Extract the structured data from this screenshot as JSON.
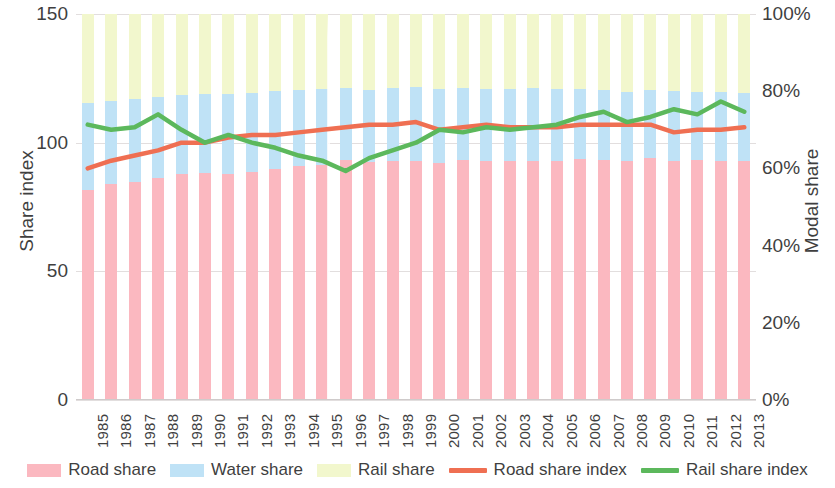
{
  "chart_data": {
    "type": "bar",
    "title": "",
    "subtitle": "",
    "xlabel": "",
    "ylabel": "Share index",
    "y2label": "Modal share",
    "grid": true,
    "legend_position": "bottom",
    "ylim": [
      0,
      150
    ],
    "y2lim": [
      0,
      100
    ],
    "y_ticks": [
      "0",
      "50",
      "100",
      "150"
    ],
    "y_tick_values": [
      0,
      50,
      100,
      150
    ],
    "y2_ticks": [
      "0%",
      "20%",
      "40%",
      "60%",
      "80%",
      "100%"
    ],
    "y2_tick_values": [
      0,
      20,
      40,
      60,
      80,
      100
    ],
    "categories": [
      "1985",
      "1986",
      "1987",
      "1988",
      "1989",
      "1990",
      "1991",
      "1992",
      "1993",
      "1994",
      "1995",
      "1996",
      "1997",
      "1998",
      "1999",
      "2000",
      "2001",
      "2002",
      "2003",
      "2004",
      "2005",
      "2006",
      "2007",
      "2008",
      "2009",
      "2010",
      "2011",
      "2012",
      "2013"
    ],
    "stacked": true,
    "series": [
      {
        "name": "Road share",
        "kind": "bar",
        "axis": "right",
        "unit": "%",
        "color": "#fbb8c0",
        "values": [
          54.5,
          55.9,
          56.5,
          57.5,
          58.5,
          58.8,
          58.5,
          59.0,
          59.8,
          60.5,
          61.0,
          62.2,
          61.6,
          61.8,
          61.9,
          61.5,
          62.3,
          61.9,
          62.0,
          62.0,
          62.0,
          62.5,
          62.3,
          62.0,
          62.6,
          62.0,
          62.1,
          61.9,
          62.0
        ]
      },
      {
        "name": "Water share",
        "kind": "bar",
        "axis": "right",
        "unit": "%",
        "color": "#bfe2f6",
        "values": [
          22.5,
          21.5,
          21.5,
          21.0,
          20.5,
          20.5,
          20.8,
          20.5,
          20.2,
          19.8,
          19.5,
          18.5,
          18.8,
          19.0,
          19.2,
          19.0,
          18.5,
          18.6,
          18.5,
          18.8,
          18.5,
          18.0,
          17.9,
          17.8,
          17.8,
          18.0,
          17.7,
          17.8,
          17.5
        ]
      },
      {
        "name": "Rail share",
        "kind": "bar",
        "axis": "right",
        "unit": "%",
        "color": "#f2f7cd",
        "values": [
          23.0,
          22.6,
          22.0,
          21.5,
          21.0,
          20.7,
          20.7,
          20.5,
          20.0,
          19.7,
          19.5,
          19.3,
          19.6,
          19.2,
          18.9,
          19.5,
          19.2,
          19.5,
          19.5,
          19.2,
          19.5,
          19.5,
          19.8,
          20.2,
          19.6,
          20.0,
          20.2,
          20.3,
          20.5
        ]
      },
      {
        "name": "Road share index",
        "kind": "line",
        "axis": "left",
        "color": "#ef6f52",
        "values": [
          90,
          93,
          95,
          97,
          100,
          100,
          102,
          103,
          103,
          104,
          105,
          106,
          107,
          107,
          108,
          105,
          106,
          107,
          106,
          106,
          106,
          107,
          107,
          107,
          107,
          104,
          105,
          105,
          106
        ]
      },
      {
        "name": "Rail share index",
        "kind": "line",
        "axis": "left",
        "color": "#5cb85c",
        "values": [
          107,
          105,
          106,
          111,
          105,
          100,
          103,
          100,
          98,
          95,
          93,
          89,
          94,
          97,
          100,
          105,
          104,
          106,
          105,
          106,
          107,
          110,
          112,
          108,
          110,
          113,
          111,
          116,
          112
        ]
      }
    ],
    "legend": [
      {
        "label": "Road share",
        "type": "box",
        "color": "#fbb8c0"
      },
      {
        "label": "Water share",
        "type": "box",
        "color": "#bfe2f6"
      },
      {
        "label": "Rail share",
        "type": "box",
        "color": "#f2f7cd"
      },
      {
        "label": "Road share index",
        "type": "line",
        "color": "#ef6f52"
      },
      {
        "label": "Rail share index",
        "type": "line",
        "color": "#5cb85c"
      }
    ],
    "annotations": [
      {
        "name": "bar-gap-artifact",
        "category": "1995",
        "note": ""
      }
    ]
  }
}
